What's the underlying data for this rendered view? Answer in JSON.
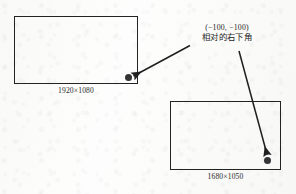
{
  "figure": {
    "type": "annotated-diagram",
    "background_color": "#fdfdfd",
    "stroke_color": "#232323",
    "dot_color": "#333336"
  },
  "annotation": {
    "coordinates": "(−100, −100)",
    "label": "相对的右下角"
  },
  "screens": [
    {
      "name": "primary-screen",
      "caption": "1920×1080",
      "width": 1920,
      "height": 1080,
      "dot_position": "bottom-right-inside"
    },
    {
      "name": "secondary-screen",
      "caption": "1680×1050",
      "width": 1680,
      "height": 1050,
      "dot_position": "bottom-right-inside"
    }
  ],
  "arrows": [
    {
      "name": "arrow-to-primary-dot",
      "from": "annotation",
      "to": "primary-screen-dot",
      "direction": "down-left"
    },
    {
      "name": "arrow-to-secondary-dot",
      "from": "annotation",
      "to": "secondary-screen-dot",
      "direction": "down-right"
    }
  ]
}
